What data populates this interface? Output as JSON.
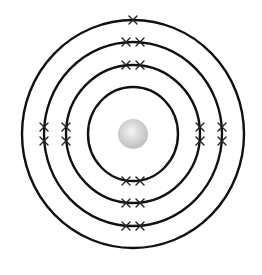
{
  "diagram": {
    "type": "bohr-model",
    "electron_configuration": [
      2,
      8,
      8,
      1
    ],
    "center": [
      133,
      134
    ],
    "colors": {
      "shell_stroke": "#111111",
      "electron_mark": "#222222",
      "nucleus_light": "#f4f4f4",
      "nucleus_dark": "#bcbcbc",
      "background": "#ffffff"
    },
    "nucleus": {
      "radius": 15
    },
    "shells": [
      {
        "name": "shell-1",
        "rx": 45,
        "ry": 47,
        "electrons": [
          {
            "pos": "bottom",
            "dx": -7
          },
          {
            "pos": "bottom",
            "dx": 7
          }
        ]
      },
      {
        "name": "shell-2",
        "rx": 67,
        "ry": 69,
        "electrons": [
          {
            "pos": "top",
            "dx": -7
          },
          {
            "pos": "top",
            "dx": 7
          },
          {
            "pos": "bottom",
            "dx": -7
          },
          {
            "pos": "bottom",
            "dx": 7
          },
          {
            "pos": "left",
            "dy": -7
          },
          {
            "pos": "left",
            "dy": 7
          },
          {
            "pos": "right",
            "dy": -7
          },
          {
            "pos": "right",
            "dy": 7
          }
        ]
      },
      {
        "name": "shell-3",
        "rx": 89,
        "ry": 92,
        "electrons": [
          {
            "pos": "top",
            "dx": -7
          },
          {
            "pos": "top",
            "dx": 7
          },
          {
            "pos": "bottom",
            "dx": -7
          },
          {
            "pos": "bottom",
            "dx": 7
          },
          {
            "pos": "left",
            "dy": -7
          },
          {
            "pos": "left",
            "dy": 7
          },
          {
            "pos": "right",
            "dy": -7
          },
          {
            "pos": "right",
            "dy": 7
          }
        ]
      },
      {
        "name": "shell-4",
        "rx": 111,
        "ry": 114,
        "electrons": [
          {
            "pos": "top",
            "dx": 0
          }
        ]
      }
    ]
  }
}
